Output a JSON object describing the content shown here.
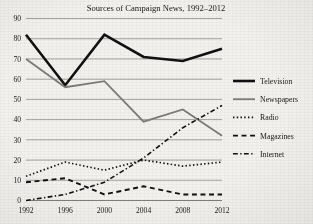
{
  "chart_data": {
    "type": "line",
    "title": "Sources of Campaign News, 1992–2012",
    "xlabel": "",
    "ylabel": "",
    "categories": [
      "1992",
      "1996",
      "2000",
      "2004",
      "2008",
      "2012"
    ],
    "x": [
      1992,
      1996,
      2000,
      2004,
      2008,
      2012
    ],
    "xlim": [
      1992,
      2012
    ],
    "ylim": [
      0,
      90
    ],
    "yticks": [
      0,
      10,
      20,
      30,
      40,
      50,
      60,
      70,
      80,
      90
    ],
    "ytick_labels": [
      "0",
      "10",
      "20",
      "30",
      "40",
      "50",
      "60",
      "70",
      "80",
      "90"
    ],
    "grid": true,
    "legend_position": "right",
    "series": [
      {
        "name": "Television",
        "values": [
          82,
          57,
          82,
          71,
          69,
          75
        ],
        "style": "solid",
        "color": "#111111",
        "width": 2.6
      },
      {
        "name": "Newspapers",
        "values": [
          70,
          56,
          59,
          39,
          45,
          32
        ],
        "style": "solid",
        "color": "#7b7b7b",
        "width": 1.8
      },
      {
        "name": "Radio",
        "values": [
          12,
          19,
          15,
          20,
          17,
          19
        ],
        "style": "dotted",
        "color": "#111111",
        "width": 1.7
      },
      {
        "name": "Magazines",
        "values": [
          9,
          11,
          3,
          7,
          3,
          3
        ],
        "style": "dashed",
        "color": "#111111",
        "width": 1.9
      },
      {
        "name": "Internet",
        "values": [
          0,
          3,
          9,
          21,
          36,
          47
        ],
        "style": "dashdot",
        "color": "#111111",
        "width": 1.6
      }
    ]
  },
  "legend": {
    "items": [
      {
        "label": "Television"
      },
      {
        "label": "Newspapers"
      },
      {
        "label": "Radio"
      },
      {
        "label": "Magazines"
      },
      {
        "label": "Internet"
      }
    ]
  }
}
